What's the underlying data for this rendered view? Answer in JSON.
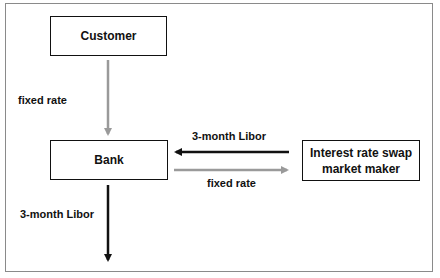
{
  "diagram": {
    "nodes": {
      "customer": {
        "label": "Customer"
      },
      "bank": {
        "label": "Bank"
      },
      "market_maker": {
        "label": "Interest rate swap market maker",
        "line1": "Interest rate swap",
        "line2": "market maker"
      }
    },
    "edges": {
      "customer_to_bank": {
        "label": "fixed rate",
        "color": "#9a9a9a"
      },
      "mm_to_bank": {
        "label": "3-month Libor",
        "color": "#111111"
      },
      "bank_to_mm": {
        "label": "fixed rate",
        "color": "#9a9a9a"
      },
      "bank_out": {
        "label": "3-month Libor",
        "color": "#111111"
      }
    }
  }
}
